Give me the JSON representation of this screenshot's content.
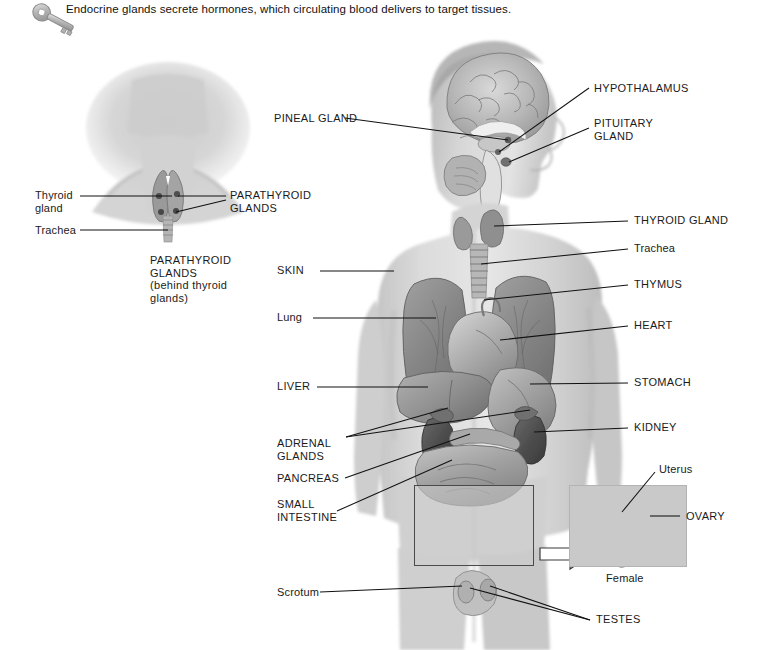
{
  "header": {
    "icon": "key-icon",
    "text": "Endocrine glands secrete hormones, which circulating blood delivers to target tissues."
  },
  "figures": {
    "neck_inset": {
      "name": "posterior neck view",
      "labels": [
        {
          "id": "thyroid-gland",
          "text": "Thyroid\ngland",
          "style": "mixed"
        },
        {
          "id": "trachea",
          "text": "Trachea",
          "style": "mixed"
        },
        {
          "id": "parathyroid-right",
          "text": "PARATHYROID\nGLANDS",
          "style": "caps"
        },
        {
          "id": "parathyroid-note",
          "text": "PARATHYROID\nGLANDS\n(behind thyroid\nglands)",
          "style": "caps-note"
        }
      ]
    },
    "main_figure": {
      "name": "male body with endocrine organs",
      "labels_left": [
        {
          "id": "pineal-gland",
          "text": "PINEAL GLAND",
          "style": "caps"
        },
        {
          "id": "skin",
          "text": "SKIN",
          "style": "caps"
        },
        {
          "id": "lung",
          "text": "Lung",
          "style": "mixed"
        },
        {
          "id": "liver",
          "text": "LIVER",
          "style": "caps"
        },
        {
          "id": "adrenal-glands",
          "text": "ADRENAL\nGLANDS",
          "style": "caps"
        },
        {
          "id": "pancreas",
          "text": "PANCREAS",
          "style": "caps"
        },
        {
          "id": "small-intestine",
          "text": "SMALL\nINTESTINE",
          "style": "caps"
        },
        {
          "id": "scrotum",
          "text": "Scrotum",
          "style": "mixed"
        }
      ],
      "labels_right": [
        {
          "id": "hypothalamus",
          "text": "HYPOTHALAMUS",
          "style": "caps"
        },
        {
          "id": "pituitary-gland",
          "text": "PITUITARY\nGLAND",
          "style": "caps"
        },
        {
          "id": "thyroid-gland",
          "text": "THYROID GLAND",
          "style": "caps"
        },
        {
          "id": "trachea",
          "text": "Trachea",
          "style": "mixed"
        },
        {
          "id": "thymus",
          "text": "THYMUS",
          "style": "caps"
        },
        {
          "id": "heart",
          "text": "HEART",
          "style": "caps"
        },
        {
          "id": "stomach",
          "text": "STOMACH",
          "style": "caps"
        },
        {
          "id": "kidney",
          "text": "KIDNEY",
          "style": "caps"
        },
        {
          "id": "testes",
          "text": "TESTES",
          "style": "caps"
        }
      ]
    },
    "female_inset": {
      "name": "female reproductive organs",
      "caption": "Female",
      "labels": [
        {
          "id": "uterus",
          "text": "Uterus",
          "style": "mixed"
        },
        {
          "id": "ovary",
          "text": "OVARY",
          "style": "caps"
        }
      ]
    }
  },
  "label_text": {
    "hypothalamus": "HYPOTHALAMUS",
    "pituitary_gland": "PITUITARY\nGLAND",
    "pineal_gland": "PINEAL GLAND",
    "thyroid_gland_caps": "THYROID GLAND",
    "trachea_right": "Trachea",
    "thymus": "THYMUS",
    "heart": "HEART",
    "stomach": "STOMACH",
    "kidney": "KIDNEY",
    "skin": "SKIN",
    "lung": "Lung",
    "liver": "LIVER",
    "adrenal_glands": "ADRENAL\nGLANDS",
    "pancreas": "PANCREAS",
    "small_intestine": "SMALL\nINTESTINE",
    "scrotum": "Scrotum",
    "testes": "TESTES",
    "thyroid_gland_mixed": "Thyroid\ngland",
    "trachea_left": "Trachea",
    "parathyroid_glands": "PARATHYROID\nGLANDS",
    "parathyroid_note": "PARATHYROID\nGLANDS\n(behind thyroid\nglands)",
    "uterus": "Uterus",
    "ovary": "OVARY",
    "female": "Female"
  },
  "colors": {
    "background": "#ffffff",
    "text": "#1a1a1a",
    "leader_line": "#111111",
    "callout_border": "#4a4a4a",
    "callout_fill": "#cdcdcd",
    "inset_background": "#c9c9c9",
    "skin_light": "#dcdcdc",
    "skin_mid": "#bdbdbd",
    "organ_dark": "#6e6e6e",
    "organ_mid": "#8f8f8f"
  }
}
